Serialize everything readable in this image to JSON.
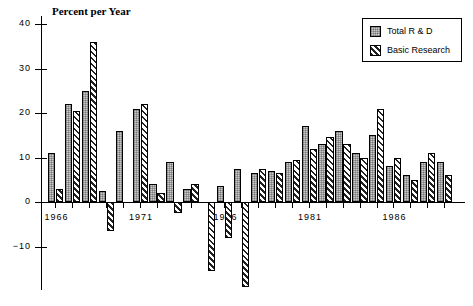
{
  "chart_data": {
    "type": "bar",
    "title": "Percent per Year",
    "xlabel": "",
    "ylabel": "Percent per Year",
    "ylim": [
      -15,
      40
    ],
    "yticks": [
      40,
      30,
      20,
      10,
      0,
      -10
    ],
    "ytick_labels": [
      "40",
      "30",
      "20",
      "10",
      "0",
      "−10"
    ],
    "xtick_labels": [
      "1966",
      "1971",
      "1976",
      "1981",
      "1986"
    ],
    "xticks": [
      1966,
      1971,
      1976,
      1981,
      1986
    ],
    "grid": false,
    "legend_position": "top-right",
    "categories": [
      1966,
      1967,
      1968,
      1969,
      1970,
      1971,
      1972,
      1973,
      1974,
      1975,
      1976,
      1977,
      1978,
      1979,
      1980,
      1981,
      1982,
      1983,
      1984,
      1985,
      1986,
      1987,
      1988,
      1989
    ],
    "series": [
      {
        "name": "Total R & D",
        "values": [
          11,
          22,
          25,
          2.5,
          16,
          21,
          4,
          9,
          3,
          0,
          3.5,
          7.5,
          6.5,
          7,
          9,
          17,
          13,
          16,
          11,
          15,
          8,
          6,
          9,
          9
        ]
      },
      {
        "name": "Basic Research",
        "values": [
          3,
          20.5,
          36,
          -6.5,
          0,
          22,
          2,
          -2.5,
          4,
          -15.5,
          -8,
          -19,
          7.5,
          6.5,
          9.5,
          12,
          14.5,
          13,
          10,
          21,
          10,
          5,
          11,
          6
        ]
      }
    ]
  },
  "legend": {
    "items": [
      {
        "label": "Total R & D",
        "swatch": "total"
      },
      {
        "label": "Basic Research",
        "swatch": "basic"
      }
    ]
  },
  "colors": {
    "total_fill": "#c9c9c9",
    "basic_fill": "#ffffff",
    "hatch": "#222222",
    "axis": "#000000"
  }
}
